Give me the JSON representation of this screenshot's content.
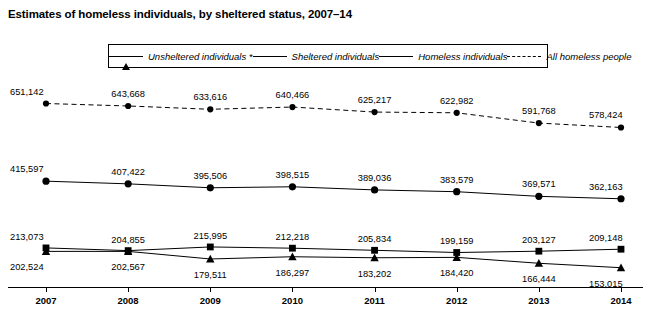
{
  "title": "Estimates of homeless individuals, by sheltered status, 2007–14",
  "legend": [
    {
      "label": "Unsheltered individuals *",
      "marker": "triangle",
      "style": "solid"
    },
    {
      "label": "Sheltered individuals",
      "marker": "square",
      "style": "solid"
    },
    {
      "label": "Homeless individuals",
      "marker": "circle",
      "style": "solid"
    },
    {
      "label": "All homeless people",
      "marker": "circle-small",
      "style": "dashed"
    }
  ],
  "chart_data": {
    "type": "line",
    "title": "Estimates of homeless individuals, by sheltered status, 2007–14",
    "xlabel": "",
    "ylabel": "",
    "x": [
      "2007",
      "2008",
      "2009",
      "2010",
      "2011",
      "2012",
      "2013",
      "2014"
    ],
    "categories": [
      "2007",
      "2008",
      "2009",
      "2010",
      "2011",
      "2012",
      "2013",
      "2014"
    ],
    "ylim": [
      140000,
      680000
    ],
    "grid": false,
    "legend_position": "top",
    "series": [
      {
        "name": "All homeless people",
        "marker": "circle-small",
        "style": "dashed",
        "values": [
          651142,
          643668,
          633616,
          640466,
          625217,
          622982,
          591768,
          578424
        ],
        "labels": [
          "651,142",
          "643,668",
          "633,616",
          "640,466",
          "625,217",
          "622,982",
          "591,768",
          "578,424"
        ]
      },
      {
        "name": "Homeless individuals",
        "marker": "circle",
        "style": "solid",
        "values": [
          415597,
          407422,
          395506,
          398515,
          389036,
          383579,
          369571,
          362163
        ],
        "labels": [
          "415,597",
          "407,422",
          "395,506",
          "398,515",
          "389,036",
          "383,579",
          "369,571",
          "362,163"
        ]
      },
      {
        "name": "Sheltered individuals",
        "marker": "square",
        "style": "solid",
        "values": [
          213073,
          204855,
          215995,
          212218,
          205834,
          199159,
          203127,
          209148
        ],
        "labels": [
          "213,073",
          "204,855",
          "215,995",
          "212,218",
          "205,834",
          "199,159",
          "203,127",
          "209,148"
        ]
      },
      {
        "name": "Unsheltered individuals *",
        "marker": "triangle",
        "style": "solid",
        "values": [
          202524,
          202567,
          179511,
          186297,
          183202,
          184420,
          166444,
          153015
        ],
        "labels": [
          "202,524",
          "202,567",
          "179,511",
          "186,297",
          "183,202",
          "184,420",
          "166,444",
          "153,015"
        ]
      }
    ]
  }
}
